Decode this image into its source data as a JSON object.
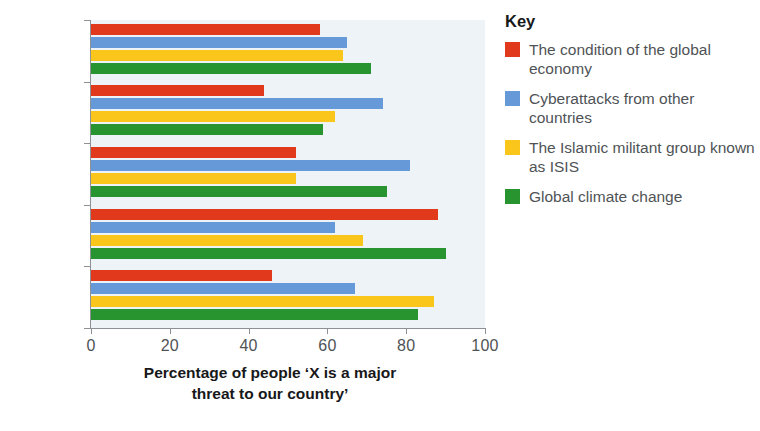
{
  "chart_data": {
    "type": "bar",
    "orientation": "horizontal",
    "title": "",
    "xlabel": "Percentage of people ‘X is a major threat to our country’",
    "ylabel": "",
    "xlim": [
      0,
      100
    ],
    "xticks": [
      0,
      20,
      40,
      60,
      80,
      100
    ],
    "grid": false,
    "legend_position": "right",
    "categories": [
      "Kenya",
      "USA",
      "Japan",
      "Greece",
      "France"
    ],
    "series": [
      {
        "name": "The condition of the global economy",
        "color": "#e1391b",
        "values": [
          58,
          44,
          52,
          88,
          46
        ]
      },
      {
        "name": "Cyberattacks from other countries",
        "color": "#6699d8",
        "values": [
          65,
          74,
          81,
          62,
          67
        ]
      },
      {
        "name": "The Islamic militant group known as ISIS",
        "color": "#fbc61c",
        "values": [
          64,
          62,
          52,
          69,
          87
        ]
      },
      {
        "name": "Global climate change",
        "color": "#279430",
        "values": [
          71,
          59,
          75,
          90,
          83
        ]
      }
    ]
  },
  "axis": {
    "x_title_line1": "Percentage of people ‘X is a major",
    "x_title_line2": "threat to our country’",
    "tick_labels": [
      "0",
      "20",
      "40",
      "60",
      "80",
      "100"
    ]
  },
  "legend": {
    "title": "Key",
    "items": [
      {
        "label": "The condition of the global economy",
        "color": "#e1391b"
      },
      {
        "label": "Cyberattacks from other countries",
        "color": "#6699d8"
      },
      {
        "label": "The Islamic militant group known as ISIS",
        "color": "#fbc61c"
      },
      {
        "label": "Global climate change",
        "color": "#279430"
      }
    ]
  }
}
